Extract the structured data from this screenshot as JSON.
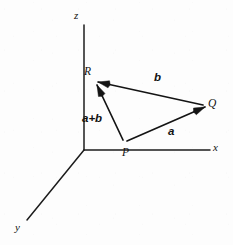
{
  "figure": {
    "kind": "vector-addition-triangle-3d-axes",
    "background_color": "#fdfdfd",
    "ink_color": "#141414",
    "width": 233,
    "height": 245
  },
  "axes": {
    "origin": {
      "x": 84,
      "y": 150
    },
    "items": [
      {
        "id": "z",
        "label": "z",
        "label_x": 74,
        "label_y": 10,
        "x1": 84,
        "y1": 150,
        "x2": 84,
        "y2": 25
      },
      {
        "id": "x",
        "label": "x",
        "label_x": 213,
        "label_y": 142,
        "x1": 84,
        "y1": 150,
        "x2": 210,
        "y2": 150
      },
      {
        "id": "y",
        "label": "y",
        "label_x": 15,
        "label_y": 222,
        "x1": 84,
        "y1": 150,
        "x2": 27,
        "y2": 220
      }
    ]
  },
  "points": [
    {
      "id": "P",
      "label": "P",
      "x": 124,
      "y": 143,
      "label_x": 122,
      "label_y": 147
    },
    {
      "id": "Q",
      "label": "Q",
      "x": 205,
      "y": 107,
      "label_x": 208,
      "label_y": 98
    },
    {
      "id": "R",
      "label": "R",
      "x": 96,
      "y": 83,
      "label_x": 84,
      "label_y": 66
    }
  ],
  "vectors": [
    {
      "id": "a",
      "label": "a",
      "from": "P",
      "to": "Q",
      "x1": 127,
      "y1": 141,
      "x2": 205,
      "y2": 107,
      "label_x": 168,
      "label_y": 126
    },
    {
      "id": "b",
      "label": "b",
      "from": "Q",
      "to": "R",
      "x1": 203,
      "y1": 105,
      "x2": 98,
      "y2": 82,
      "label_x": 154,
      "label_y": 72
    },
    {
      "id": "a_plus_b",
      "label": "a+b",
      "from": "P",
      "to": "R",
      "x1": 123,
      "y1": 140,
      "x2": 97,
      "y2": 85,
      "label_x": 82,
      "label_y": 113
    }
  ]
}
